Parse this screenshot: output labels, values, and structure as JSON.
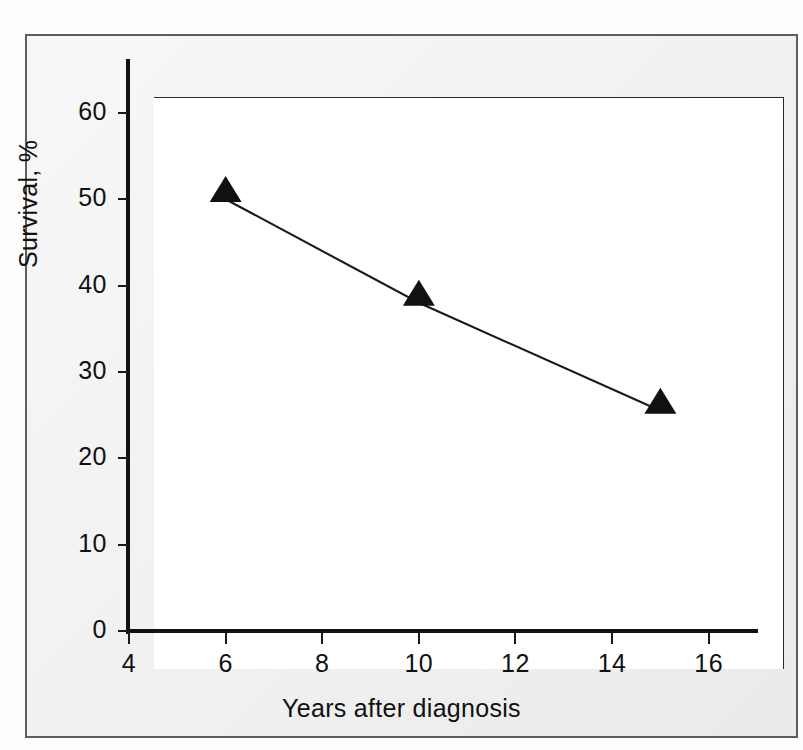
{
  "figure": {
    "background_color": "#eeeeee",
    "plot_background_color": "#ffffff",
    "border_color": "#5e5e5e",
    "axis_color": "#111111"
  },
  "chart_data": {
    "type": "line",
    "title": "",
    "subtitle": "",
    "xlabel": "Years after diagnosis",
    "ylabel": "Survival, %",
    "xlim": [
      4,
      17
    ],
    "ylim": [
      0,
      66
    ],
    "xticks": [
      4,
      6,
      8,
      10,
      12,
      14,
      16
    ],
    "xtick_labels": [
      "4",
      "6",
      "8",
      "10",
      "12",
      "14",
      "16"
    ],
    "yticks": [
      0,
      10,
      20,
      30,
      40,
      50,
      60
    ],
    "ytick_labels": [
      "0",
      "10",
      "20",
      "30",
      "40",
      "50",
      "60"
    ],
    "grid": false,
    "legend_position": "none",
    "marker": "triangle-up-filled",
    "marker_color": "#111111",
    "line_color": "#1a1a1a",
    "series": [
      {
        "name": "Survival",
        "x": [
          6,
          10,
          15
        ],
        "values": [
          50,
          38,
          25.5
        ],
        "points": [
          {
            "x": 6,
            "y": 50
          },
          {
            "x": 10,
            "y": 38
          },
          {
            "x": 15,
            "y": 25.5
          }
        ]
      }
    ],
    "annotations": []
  }
}
